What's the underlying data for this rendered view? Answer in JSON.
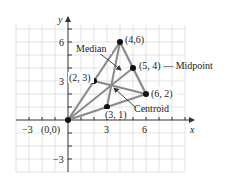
{
  "figure": {
    "axes": {
      "x_label": "x",
      "y_label": "y",
      "x_ticks": [
        {
          "value": -3,
          "label": "−3"
        },
        {
          "value": 3,
          "label": "3"
        },
        {
          "value": 6,
          "label": "6"
        }
      ],
      "y_ticks": [
        {
          "value": 6,
          "label": "6"
        },
        {
          "value": 3,
          "label": "3"
        },
        {
          "value": -3,
          "label": "−3"
        }
      ],
      "xlim": [
        -4,
        9
      ],
      "ylim": [
        -4,
        7
      ]
    },
    "triangle": {
      "vertices": [
        {
          "x": 0,
          "y": 0,
          "label": "(0,0)"
        },
        {
          "x": 4,
          "y": 6,
          "label": "(4,6)"
        },
        {
          "x": 6,
          "y": 2,
          "label": "(6, 2)"
        }
      ],
      "midpoints": [
        {
          "x": 2,
          "y": 3,
          "label": "(2, 3)"
        },
        {
          "x": 5,
          "y": 4,
          "label": "(5, 4) — Midpoint"
        },
        {
          "x": 3,
          "y": 1,
          "label": "(3, 1)"
        }
      ]
    },
    "annotations": {
      "median_label": "Median",
      "centroid_label": "Centroid"
    },
    "colors": {
      "grid": "#dcdcdc",
      "axis": "#333333",
      "triangle": "#8a8a8a",
      "point": "#111111"
    }
  }
}
